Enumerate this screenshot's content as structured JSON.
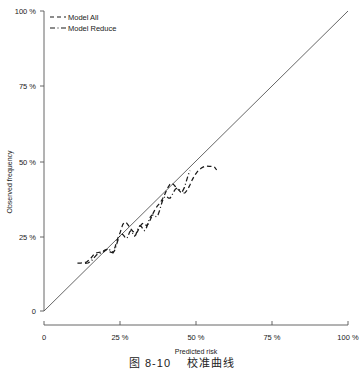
{
  "figure": {
    "caption_figure_number": "图 8-10",
    "caption_title": "校准曲线"
  },
  "chart_data": {
    "type": "line",
    "title": "",
    "subtitle": "",
    "xlabel": "Predicted risk",
    "ylabel": "Observed frequency",
    "xlim": [
      0,
      100
    ],
    "ylim": [
      0,
      100
    ],
    "xticks": [
      0,
      25,
      50,
      75,
      100
    ],
    "yticks": [
      0,
      25,
      50,
      75,
      100
    ],
    "xtick_labels": [
      "0",
      "25 %",
      "50 %",
      "75 %",
      "100 %"
    ],
    "ytick_labels": [
      "0",
      "25 %",
      "50 %",
      "75 %",
      "100 %"
    ],
    "grid": false,
    "legend_position": "top-left",
    "reference_line": {
      "name": "Ideal (identity) line",
      "style": "solid",
      "color": "#555555",
      "x": [
        0,
        100
      ],
      "y": [
        0,
        100
      ]
    },
    "series": [
      {
        "name": "Model All",
        "style": "dashed",
        "color": "#1a1a1a",
        "x": [
          11.0,
          12.0,
          13.0,
          14.0,
          15.2,
          16.2,
          17.0,
          17.8,
          18.6,
          19.3,
          20.0,
          20.7,
          21.3,
          21.9,
          22.4,
          22.9,
          23.4,
          23.9,
          24.3,
          24.7,
          25.1,
          25.5,
          25.9,
          26.3,
          26.8,
          27.2,
          27.7,
          28.2,
          28.7,
          29.2,
          29.7,
          30.2,
          30.7,
          31.2,
          31.7,
          32.2,
          32.7,
          33.2,
          33.7,
          34.2,
          34.8,
          35.4,
          36.0,
          36.6,
          37.2,
          37.8,
          38.4,
          39.0,
          39.6,
          40.2,
          40.8,
          41.4,
          42.0,
          42.6,
          43.2,
          43.8,
          44.4,
          45.0,
          45.7,
          46.4,
          47.2,
          48.0,
          48.8,
          49.6,
          50.4,
          51.2,
          52.0,
          52.8,
          53.6,
          54.4,
          55.2,
          56.0,
          56.8
        ],
        "y": [
          16.0,
          16.0,
          16.1,
          16.3,
          17.3,
          18.6,
          19.3,
          19.5,
          19.6,
          19.9,
          20.3,
          20.5,
          20.0,
          19.6,
          19.5,
          20.0,
          21.4,
          23.0,
          24.3,
          25.2,
          26.3,
          27.6,
          28.8,
          29.4,
          29.6,
          29.3,
          28.6,
          27.8,
          27.2,
          26.6,
          26.2,
          25.9,
          26.4,
          27.4,
          28.4,
          29.0,
          29.3,
          29.0,
          28.4,
          28.9,
          30.0,
          31.4,
          32.8,
          34.0,
          34.9,
          35.6,
          36.4,
          37.4,
          38.6,
          40.0,
          41.2,
          42.2,
          42.6,
          42.2,
          41.5,
          40.8,
          40.2,
          39.6,
          39.2,
          39.4,
          40.4,
          42.0,
          43.8,
          45.3,
          46.4,
          47.2,
          47.8,
          48.2,
          48.3,
          48.2,
          48.2,
          48.1,
          47.0
        ]
      },
      {
        "name": "Model Reduce",
        "style": "dashdot",
        "color": "#1a1a1a",
        "x": [
          13.5,
          14.5,
          15.5,
          16.5,
          17.4,
          18.2,
          19.0,
          19.7,
          20.4,
          21.0,
          21.6,
          22.2,
          22.7,
          23.2,
          23.7,
          24.2,
          24.6,
          25.0,
          25.4,
          25.8,
          26.2,
          26.6,
          27.0,
          27.4,
          27.8,
          28.2,
          28.6,
          29.0,
          29.4,
          29.8,
          30.2,
          30.6,
          31.0,
          31.5,
          32.0,
          32.5,
          33.0,
          33.5,
          34.0,
          34.5,
          35.0,
          35.5,
          36.0,
          36.5,
          37.0,
          37.5,
          38.0,
          38.5,
          39.0,
          39.5,
          40.0,
          40.5,
          41.0,
          41.5,
          42.0,
          42.6,
          43.2,
          43.8,
          44.4,
          45.0,
          45.6,
          46.2,
          46.8,
          47.4,
          48.0
        ],
        "y": [
          15.9,
          16.0,
          16.6,
          17.8,
          18.8,
          19.2,
          19.4,
          19.8,
          20.3,
          20.7,
          20.4,
          19.7,
          19.4,
          20.1,
          21.6,
          23.2,
          24.4,
          25.0,
          25.4,
          25.6,
          25.2,
          24.6,
          24.2,
          24.5,
          25.4,
          26.4,
          26.8,
          26.2,
          25.4,
          25.0,
          25.4,
          26.6,
          27.8,
          28.4,
          28.2,
          27.4,
          26.8,
          27.2,
          28.6,
          30.2,
          31.4,
          32.0,
          32.0,
          31.6,
          31.4,
          32.0,
          33.4,
          35.2,
          36.8,
          37.8,
          38.2,
          38.0,
          37.6,
          37.6,
          38.4,
          39.6,
          40.6,
          41.0,
          40.6,
          40.0,
          40.0,
          41.2,
          43.2,
          45.2,
          46.8
        ]
      }
    ]
  },
  "legend": {
    "items": [
      {
        "label": "Model All",
        "style": "dashed"
      },
      {
        "label": "Model Reduce",
        "style": "dashdot"
      }
    ]
  }
}
